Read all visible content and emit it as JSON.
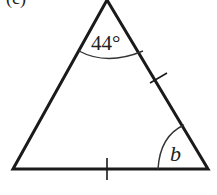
{
  "figure": {
    "partial_label": "(c)",
    "apex_angle_label": "44°",
    "base_angle_label": "b",
    "shape": "isosceles-triangle",
    "equal_sides_marked": [
      "right-side",
      "base"
    ]
  }
}
